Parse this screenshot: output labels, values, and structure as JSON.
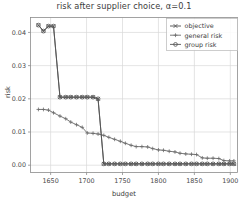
{
  "chart_data": {
    "type": "line",
    "title": "risk after supplier choice, α=0.1",
    "xlabel": "budget",
    "ylabel": "risk",
    "xlim": [
      1622,
      1910
    ],
    "ylim": [
      -0.0022,
      0.0445
    ],
    "grid": true,
    "legend_position": "upper right",
    "xticks": [
      1650,
      1700,
      1750,
      1800,
      1850,
      1900
    ],
    "xtick_labels": [
      "1650",
      "1700",
      "1750",
      "1800",
      "1850",
      "1900"
    ],
    "yticks": [
      0.0,
      0.01,
      0.02,
      0.03,
      0.04
    ],
    "ytick_labels": [
      "0.00",
      "0.01",
      "0.02",
      "0.03",
      "0.04"
    ],
    "series": [
      {
        "name": "objective",
        "marker": "x-marker",
        "color": "#4d4d4d",
        "x": [
          1633,
          1640,
          1647,
          1654,
          1663,
          1671,
          1678,
          1686,
          1694,
          1701,
          1709,
          1716,
          1724,
          1731,
          1739,
          1747,
          1754,
          1762,
          1769,
          1777,
          1785,
          1792,
          1800,
          1807,
          1815,
          1823,
          1830,
          1838,
          1846,
          1853,
          1861,
          1868,
          1876,
          1884,
          1891,
          1899,
          1905
        ],
        "y": [
          0.0422,
          0.0404,
          0.0419,
          0.0419,
          0.0205,
          0.0205,
          0.0205,
          0.0205,
          0.0205,
          0.0205,
          0.0205,
          0.02,
          0.0004,
          0.0004,
          0.0004,
          0.0004,
          0.0004,
          0.0004,
          0.0004,
          0.0004,
          0.0004,
          0.0004,
          0.0004,
          0.0004,
          0.0004,
          0.0004,
          0.0004,
          0.0004,
          0.0004,
          0.0004,
          0.0004,
          0.0004,
          0.0004,
          0.0004,
          0.0004,
          0.0004,
          0.0004
        ]
      },
      {
        "name": "general risk",
        "marker": "plus-marker",
        "color": "#6a6a6a",
        "x": [
          1633,
          1640,
          1647,
          1654,
          1663,
          1671,
          1678,
          1686,
          1694,
          1701,
          1709,
          1716,
          1724,
          1731,
          1739,
          1747,
          1754,
          1762,
          1769,
          1777,
          1785,
          1792,
          1800,
          1807,
          1815,
          1823,
          1830,
          1838,
          1846,
          1853,
          1861,
          1868,
          1876,
          1884,
          1891,
          1899,
          1905
        ],
        "y": [
          0.0168,
          0.0168,
          0.0166,
          0.0158,
          0.0148,
          0.014,
          0.013,
          0.0122,
          0.0114,
          0.0097,
          0.0096,
          0.0094,
          0.009,
          0.0084,
          0.0078,
          0.0072,
          0.0066,
          0.006,
          0.0056,
          0.0056,
          0.0055,
          0.005,
          0.0046,
          0.0045,
          0.0042,
          0.004,
          0.0036,
          0.0034,
          0.0033,
          0.0032,
          0.0022,
          0.0021,
          0.0021,
          0.002,
          0.0014,
          0.0013,
          0.0013
        ]
      },
      {
        "name": "group risk",
        "marker": "circle-marker",
        "color": "#555555",
        "x": [
          1633,
          1640,
          1647,
          1654,
          1663,
          1671,
          1678,
          1686,
          1694,
          1701,
          1709,
          1716,
          1724,
          1731,
          1739,
          1747,
          1754,
          1762,
          1769,
          1777,
          1785,
          1792,
          1800,
          1807,
          1815,
          1823,
          1830,
          1838,
          1846,
          1853,
          1861,
          1868,
          1876,
          1884,
          1891,
          1899,
          1905
        ],
        "y": [
          0.0422,
          0.0404,
          0.0419,
          0.0419,
          0.0205,
          0.0205,
          0.0205,
          0.0205,
          0.0205,
          0.0205,
          0.0205,
          0.02,
          0.0004,
          0.0004,
          0.0004,
          0.0004,
          0.0004,
          0.0004,
          0.0004,
          0.0004,
          0.0004,
          0.0004,
          0.0004,
          0.0004,
          0.0004,
          0.0004,
          0.0004,
          0.0004,
          0.0004,
          0.0004,
          0.0004,
          0.0004,
          0.0004,
          0.0004,
          0.0004,
          0.0004,
          0.0004
        ]
      }
    ]
  },
  "legend": {
    "items": [
      {
        "label": "objective"
      },
      {
        "label": "general risk"
      },
      {
        "label": "group risk"
      }
    ]
  },
  "axes": {
    "frame_color": "#8c8c8c",
    "grid_color": "#d9d9d9"
  }
}
